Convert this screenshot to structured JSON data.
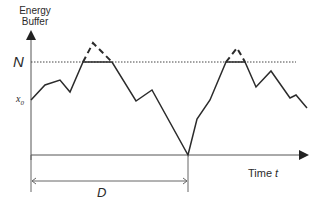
{
  "diagram": {
    "y_axis_label_line1": "Energy",
    "y_axis_label_line2": "Buffer",
    "x_axis_label": "Time",
    "x_axis_var": "t",
    "threshold_label": "N",
    "initial_label": "x",
    "initial_subscript": "0",
    "interval_label": "D",
    "colors": {
      "line": "#2b2b2b",
      "axis": "#555555",
      "dotted": "#444444"
    }
  }
}
